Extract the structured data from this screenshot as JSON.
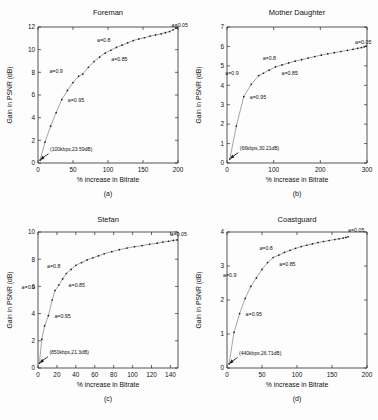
{
  "figure": {
    "panels": [
      {
        "key": "a",
        "subcaption": "(a)",
        "title": "Foreman",
        "xlabel": "% increase in Bitrate",
        "ylabel": "Gain in PSNR (dB)",
        "origin_annotation": "(100kbps,23.59dB)",
        "xticks": [
          "0",
          "50",
          "100",
          "150",
          "200"
        ],
        "yticks": [
          "0",
          "2",
          "4",
          "6",
          "8",
          "10",
          "12"
        ],
        "annotations": [
          "a=0.95",
          "a=0.9",
          "a=0.85",
          "a=0.8",
          "a=0.05"
        ]
      },
      {
        "key": "b",
        "subcaption": "(b)",
        "title": "Mother Daughter",
        "xlabel": "% increase in Bitrate",
        "ylabel": "Gain in PSNR (dB)",
        "origin_annotation": "(66kbps,30.21dB)",
        "xticks": [
          "0",
          "100",
          "200",
          "300"
        ],
        "yticks": [
          "0",
          "1",
          "2",
          "3",
          "4",
          "5",
          "6",
          "7"
        ],
        "annotations": [
          "a=0.95",
          "a=0.9",
          "a=0.85",
          "a=0.8",
          "a=0.05"
        ]
      },
      {
        "key": "c",
        "subcaption": "(c)",
        "title": "Stefan",
        "xlabel": "% increase in Bitrate",
        "ylabel": "Gain in PSNR (dB)",
        "origin_annotation": "(850kbps,21.3dB)",
        "xticks": [
          "0",
          "20",
          "40",
          "60",
          "80",
          "100",
          "120",
          "140"
        ],
        "yticks": [
          "0",
          "2",
          "4",
          "6",
          "8",
          "10"
        ],
        "annotations": [
          "a=0.95",
          "a=0.9",
          "a=0.85",
          "a=0.8",
          "a=0.05"
        ]
      },
      {
        "key": "d",
        "subcaption": "(d)",
        "title": "Coastguard",
        "xlabel": "% increase in Bitrate",
        "ylabel": "Gain in PSNR (dB)",
        "origin_annotation": "(440kbps,26.71dB)",
        "xticks": [
          "0",
          "50",
          "100",
          "150",
          "200"
        ],
        "yticks": [
          "0",
          "1",
          "2",
          "3",
          "4"
        ],
        "annotations": [
          "a=0.95",
          "a=0.9",
          "a=0.85",
          "a=0.8",
          "a=0.05"
        ]
      }
    ]
  },
  "chart_data": [
    {
      "type": "line",
      "title": "Foreman",
      "xlabel": "% increase in Bitrate",
      "ylabel": "Gain in PSNR (dB)",
      "xlim": [
        0,
        200
      ],
      "ylim": [
        0,
        12
      ],
      "xticks": [
        0,
        50,
        100,
        150,
        200
      ],
      "yticks": [
        0,
        2,
        4,
        6,
        8,
        10,
        12
      ],
      "grid": false,
      "legend": "none",
      "x": [
        3,
        10,
        18,
        26,
        34,
        42,
        50,
        58,
        64,
        72,
        80,
        88,
        96,
        104,
        112,
        120,
        128,
        136,
        144,
        152,
        160,
        168,
        176,
        182,
        188,
        193,
        197,
        199
      ],
      "y": [
        0.25,
        1.85,
        3.25,
        4.45,
        5.6,
        6.4,
        7.1,
        7.65,
        7.85,
        8.45,
        8.95,
        9.35,
        9.7,
        9.95,
        10.2,
        10.4,
        10.6,
        10.8,
        10.95,
        11.05,
        11.2,
        11.3,
        11.4,
        11.5,
        11.6,
        11.75,
        11.9,
        11.95
      ],
      "annotations": [
        {
          "label": "(100kbps,23.59dB)",
          "x": 3,
          "y": 0.25
        },
        {
          "label": "a=0.95",
          "x": 34,
          "y": 5.6
        },
        {
          "label": "a=0.9",
          "x": 64,
          "y": 7.85
        },
        {
          "label": "a=0.85",
          "x": 96,
          "y": 9.7
        },
        {
          "label": "a=0.8",
          "x": 112,
          "y": 10.2
        },
        {
          "label": "a=0.05",
          "x": 188,
          "y": 11.6
        }
      ]
    },
    {
      "type": "line",
      "title": "Mother Daughter",
      "xlabel": "% increase in Bitrate",
      "ylabel": "Gain in PSNR (dB)",
      "xlim": [
        0,
        300
      ],
      "ylim": [
        0,
        7
      ],
      "xticks": [
        0,
        100,
        200,
        300
      ],
      "yticks": [
        0,
        1,
        2,
        3,
        4,
        5,
        6,
        7
      ],
      "grid": false,
      "legend": "none",
      "x": [
        6,
        20,
        36,
        52,
        68,
        78,
        90,
        104,
        118,
        132,
        146,
        160,
        174,
        188,
        202,
        216,
        230,
        244,
        258,
        270,
        280,
        288,
        294,
        298
      ],
      "y": [
        0.2,
        1.9,
        3.42,
        4.05,
        4.5,
        4.62,
        4.78,
        4.95,
        5.05,
        5.15,
        5.24,
        5.32,
        5.4,
        5.48,
        5.55,
        5.62,
        5.68,
        5.74,
        5.8,
        5.85,
        5.9,
        5.94,
        5.98,
        6.02
      ],
      "annotations": [
        {
          "label": "(66kbps,30.21dB)",
          "x": 6,
          "y": 0.2
        },
        {
          "label": "a=0.95",
          "x": 36,
          "y": 3.42
        },
        {
          "label": "a=0.9",
          "x": 68,
          "y": 4.5
        },
        {
          "label": "a=0.85",
          "x": 104,
          "y": 4.95
        },
        {
          "label": "a=0.8",
          "x": 118,
          "y": 5.05
        },
        {
          "label": "a=0.05",
          "x": 270,
          "y": 5.85
        }
      ]
    },
    {
      "type": "line",
      "title": "Stefan",
      "xlabel": "% increase in Bitrate",
      "ylabel": "Gain in PSNR (dB)",
      "xlim": [
        0,
        148
      ],
      "ylim": [
        0,
        10
      ],
      "xticks": [
        0,
        20,
        40,
        60,
        80,
        100,
        120,
        140
      ],
      "yticks": [
        0,
        2,
        4,
        6,
        8,
        10
      ],
      "grid": false,
      "legend": "none",
      "x": [
        1.5,
        4,
        7,
        11,
        15,
        18,
        22,
        26,
        30,
        35,
        40,
        46,
        52,
        58,
        64,
        70,
        78,
        86,
        94,
        102,
        110,
        118,
        126,
        132,
        138,
        143,
        147
      ],
      "y": [
        0.35,
        2.1,
        3.1,
        3.85,
        5.0,
        5.7,
        6.1,
        6.55,
        6.95,
        7.25,
        7.55,
        7.75,
        7.95,
        8.1,
        8.25,
        8.4,
        8.55,
        8.7,
        8.82,
        8.92,
        9.0,
        9.1,
        9.18,
        9.26,
        9.32,
        9.38,
        9.42
      ],
      "annotations": [
        {
          "label": "(850kbps,21.3dB)",
          "x": 1.5,
          "y": 0.35
        },
        {
          "label": "a=0.95",
          "x": 11,
          "y": 3.85
        },
        {
          "label": "a=0.9",
          "x": 18,
          "y": 5.7
        },
        {
          "label": "a=0.85",
          "x": 26,
          "y": 6.55
        },
        {
          "label": "a=0.8",
          "x": 30,
          "y": 6.95
        },
        {
          "label": "a=0.05",
          "x": 138,
          "y": 9.32
        }
      ]
    },
    {
      "type": "line",
      "title": "Coastguard",
      "xlabel": "% increase in Bitrate",
      "ylabel": "Gain in PSNR (dB)",
      "xlim": [
        0,
        200
      ],
      "ylim": [
        0,
        4
      ],
      "xticks": [
        0,
        50,
        100,
        150,
        200
      ],
      "yticks": [
        0,
        1,
        2,
        3,
        4
      ],
      "grid": false,
      "legend": "none",
      "x": [
        3,
        10,
        18,
        26,
        34,
        42,
        50,
        58,
        66,
        74,
        82,
        90,
        98,
        106,
        114,
        122,
        130,
        138,
        146,
        154,
        160,
        166,
        170,
        173
      ],
      "y": [
        0.12,
        1.05,
        1.6,
        2.05,
        2.4,
        2.65,
        2.9,
        3.1,
        3.25,
        3.32,
        3.4,
        3.46,
        3.52,
        3.57,
        3.61,
        3.65,
        3.69,
        3.72,
        3.75,
        3.78,
        3.8,
        3.82,
        3.84,
        3.86
      ],
      "annotations": [
        {
          "label": "(440kbps,26.71dB)",
          "x": 3,
          "y": 0.12
        },
        {
          "label": "a=0.95",
          "x": 18,
          "y": 1.6
        },
        {
          "label": "a=0.9",
          "x": 42,
          "y": 2.65
        },
        {
          "label": "a=0.85",
          "x": 66,
          "y": 3.25
        },
        {
          "label": "a=0.8",
          "x": 74,
          "y": 3.32
        },
        {
          "label": "a=0.05",
          "x": 170,
          "y": 3.84
        }
      ]
    }
  ]
}
